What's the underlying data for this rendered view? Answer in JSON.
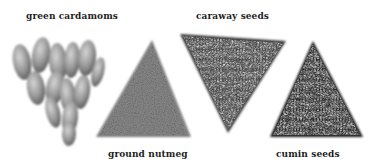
{
  "labels": {
    "cardamom": "green cardamoms",
    "caraway": "caraway seeds",
    "nutmeg": "ground nutmeg",
    "cumin": "cumin seeds"
  },
  "piles": [
    {
      "name": "green cardamoms",
      "shape": "inverted-triangle-cluster",
      "tone": "#8e8e8e"
    },
    {
      "name": "ground nutmeg",
      "shape": "upright-triangle",
      "tone": "#7a7a7a"
    },
    {
      "name": "caraway seeds",
      "shape": "inverted-triangle",
      "tone": "#3e3e3e"
    },
    {
      "name": "cumin seeds",
      "shape": "upright-triangle",
      "tone": "#1e1e1e"
    }
  ]
}
